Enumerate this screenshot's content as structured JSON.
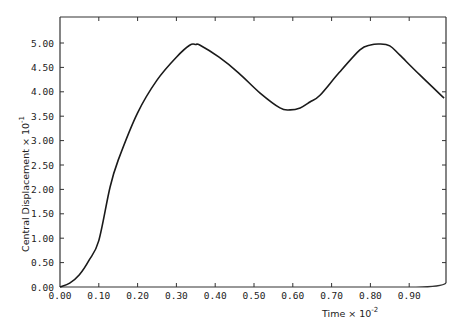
{
  "chart_data": {
    "type": "line",
    "title": "",
    "xlabel": "Time × 10",
    "xlabel_exponent": "-2",
    "ylabel": "Central  Displacement  × 10",
    "ylabel_exponent": "-1",
    "xlim": [
      0.0,
      0.99
    ],
    "ylim": [
      0.0,
      5.5
    ],
    "grid": false,
    "legend": null,
    "x_ticks": [
      "0.00",
      "0.10",
      "0.20",
      "0.30",
      "0.40",
      "0.50",
      "0.60",
      "0.70",
      "0.80",
      "0.90"
    ],
    "y_ticks": [
      "0.00",
      "0.50",
      "1.00",
      "1.50",
      "2.00",
      "2.50",
      "3.00",
      "3.50",
      "4.00",
      "4.50",
      "5.00"
    ],
    "series": [
      {
        "name": "Central Displacement",
        "color": "#1a1a1a",
        "x": [
          0.0,
          0.025,
          0.05,
          0.075,
          0.1,
          0.129,
          0.15,
          0.2,
          0.25,
          0.3,
          0.335,
          0.35,
          0.36,
          0.41,
          0.46,
          0.515,
          0.567,
          0.593,
          0.619,
          0.644,
          0.67,
          0.72,
          0.773,
          0.8,
          0.825,
          0.85,
          0.876,
          0.928,
          0.99
        ],
        "values": [
          0.0,
          0.08,
          0.25,
          0.55,
          0.95,
          2.05,
          2.6,
          3.57,
          4.24,
          4.71,
          4.96,
          4.97,
          4.96,
          4.71,
          4.39,
          3.98,
          3.67,
          3.63,
          3.67,
          3.79,
          3.93,
          4.4,
          4.86,
          4.96,
          4.98,
          4.94,
          4.75,
          4.34,
          3.87
        ]
      }
    ]
  },
  "colors": {
    "line": "#1a1a1a",
    "frame": "#333333",
    "background": "#ffffff"
  }
}
